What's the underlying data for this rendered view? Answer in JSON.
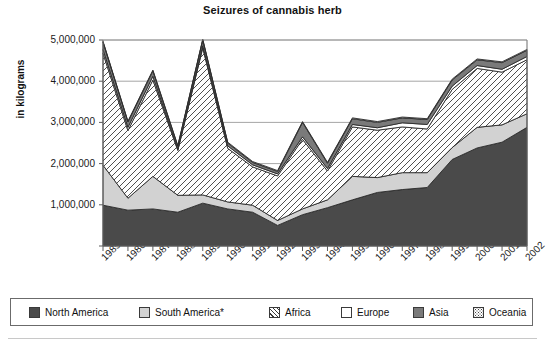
{
  "chart_data": {
    "type": "area",
    "stacked": true,
    "title": "Seizures of cannabis herb",
    "xlabel": "",
    "ylabel": "in kilograms",
    "ylim": [
      0,
      5000000
    ],
    "yticks": [
      0,
      1000000,
      2000000,
      3000000,
      4000000,
      5000000
    ],
    "ytick_labels": [
      "",
      "1,000,000",
      "2,000,000",
      "3,000,000",
      "4,000,000",
      "5,000,000"
    ],
    "grid": true,
    "legend_position": "bottom",
    "categories": [
      "1985",
      "1986",
      "1987",
      "1988",
      "1989",
      "1990",
      "1991",
      "1992",
      "1993",
      "1994",
      "1995",
      "1996",
      "1997",
      "1998",
      "1999",
      "2000",
      "2001",
      "2002"
    ],
    "series": [
      {
        "name": "North America",
        "color": "#4a4a4a",
        "pattern": "solid",
        "values": [
          990000,
          870000,
          900000,
          820000,
          1040000,
          900000,
          820000,
          500000,
          760000,
          930000,
          1120000,
          1300000,
          1370000,
          1420000,
          2100000,
          2380000,
          2520000,
          2880000
        ]
      },
      {
        "name": "South America*",
        "color": "#d2d2d2",
        "pattern": "solid",
        "values": [
          970000,
          290000,
          790000,
          410000,
          200000,
          170000,
          170000,
          120000,
          140000,
          190000,
          570000,
          360000,
          410000,
          360000,
          290000,
          500000,
          420000,
          330000
        ]
      },
      {
        "name": "Africa",
        "color": "#ffffff",
        "pattern": "diagonal-hatch",
        "values": [
          2720000,
          1640000,
          2340000,
          1090000,
          3570000,
          1300000,
          930000,
          1080000,
          1690000,
          700000,
          1200000,
          1150000,
          1110000,
          1060000,
          1410000,
          1430000,
          1280000,
          1310000
        ]
      },
      {
        "name": "Europe",
        "color": "#ffffff",
        "pattern": "none",
        "values": [
          90000,
          80000,
          90000,
          30000,
          50000,
          60000,
          50000,
          50000,
          60000,
          60000,
          60000,
          60000,
          100000,
          110000,
          80000,
          70000,
          70000,
          80000
        ]
      },
      {
        "name": "Asia",
        "color": "#7a7a7a",
        "pattern": "solid",
        "values": [
          180000,
          130000,
          130000,
          70000,
          140000,
          70000,
          60000,
          60000,
          350000,
          130000,
          140000,
          130000,
          120000,
          120000,
          150000,
          140000,
          160000,
          150000
        ]
      },
      {
        "name": "Oceania",
        "color": "#ffffff",
        "pattern": "dotted",
        "values": [
          20000,
          20000,
          20000,
          20000,
          20000,
          20000,
          20000,
          20000,
          20000,
          20000,
          20000,
          20000,
          20000,
          20000,
          20000,
          20000,
          20000,
          20000
        ]
      }
    ],
    "totals": [
      4970000,
      3030000,
      4270000,
      2440000,
      5020000,
      2520000,
      2050000,
      1830000,
      3020000,
      2030000,
      3110000,
      3020000,
      3130000,
      3090000,
      4050000,
      4540000,
      4470000,
      4750000
    ]
  },
  "legend": {
    "items": [
      {
        "label": "North America",
        "swatch": "sw-north"
      },
      {
        "label": "South America*",
        "swatch": "sw-south"
      },
      {
        "label": "Africa",
        "swatch": "sw-africa"
      },
      {
        "label": "Europe",
        "swatch": "sw-europe"
      },
      {
        "label": "Asia",
        "swatch": "sw-asia"
      },
      {
        "label": "Oceania",
        "swatch": "sw-oceania"
      }
    ]
  }
}
